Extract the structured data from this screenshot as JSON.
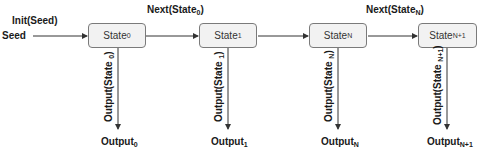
{
  "diagram": {
    "input": {
      "label": "Seed",
      "edge_label": "Init(Seed)"
    },
    "states": [
      {
        "base": "State",
        "sub": "0"
      },
      {
        "base": "State",
        "sub": "1"
      },
      {
        "base": "State",
        "sub": "N"
      },
      {
        "base": "State",
        "sub": "N+1"
      }
    ],
    "transitions": [
      {
        "from": 0,
        "to": 1,
        "base": "Next(State",
        "sub": "0",
        "close": ")"
      },
      {
        "from": 1,
        "to": 2,
        "base": "",
        "sub": "",
        "close": ""
      },
      {
        "from": 2,
        "to": 3,
        "base": "Next(State",
        "sub": "N",
        "close": ")"
      }
    ],
    "output_edges": [
      {
        "base": "Output(State ",
        "sub": "0",
        "close": ")"
      },
      {
        "base": "Output(State ",
        "sub": "1",
        "close": ")"
      },
      {
        "base": "Output(State ",
        "sub": "N",
        "close": ")"
      },
      {
        "base": "Output(State ",
        "sub": "N+1",
        "close": ")"
      }
    ],
    "outputs": [
      {
        "base": "Output",
        "sub": "0"
      },
      {
        "base": "Output",
        "sub": "1"
      },
      {
        "base": "Output",
        "sub": "N"
      },
      {
        "base": "Output",
        "sub": "N+1"
      }
    ],
    "colors": {
      "box_fill": "#f2f2f2",
      "box_border": "#7a7a7a",
      "line": "#333333"
    }
  }
}
